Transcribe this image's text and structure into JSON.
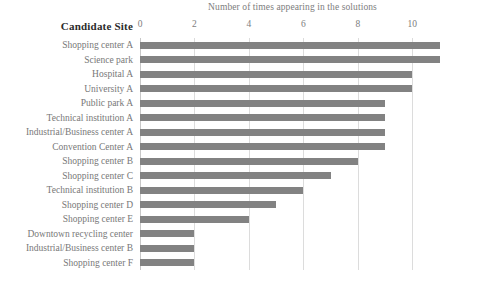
{
  "chart_data": {
    "type": "bar",
    "orientation": "horizontal",
    "title": "",
    "xlabel": "Number of times appearing in the solutions",
    "ylabel": "Candidate Site",
    "xlim": [
      0,
      11.2
    ],
    "xticks": [
      0,
      2,
      4,
      6,
      8,
      10
    ],
    "xtick_labels": [
      "0",
      "2",
      "4",
      "6",
      "8",
      "10"
    ],
    "grid": true,
    "legend": false,
    "bar_color": "#828282",
    "categories": [
      "Shopping center A",
      "Science park",
      "Hospital A",
      "University A",
      "Public park A",
      "Technical institution A",
      "Industrial/Business center A",
      "Convention Center A",
      "Shopping center B",
      "Shopping center C",
      "Technical institution B",
      "Shopping center D",
      "Shopping center E",
      "Downtown recycling center",
      "Industrial/Business center B",
      "Shopping center F"
    ],
    "values": [
      11,
      11,
      10,
      10,
      9,
      9,
      9,
      9,
      8,
      7,
      6,
      5,
      4,
      2,
      2,
      2
    ]
  }
}
